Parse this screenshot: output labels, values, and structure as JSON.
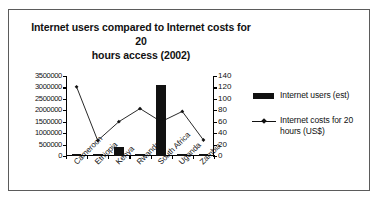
{
  "chart_data": {
    "type": "bar",
    "title": "Internet users compared to Internet costs for 20 hours access (2002)",
    "title_line1": "Internet users compared to Internet costs for 20",
    "title_line2": "hours access (2002)",
    "xlabel": "",
    "ylabel": "",
    "grid": false,
    "legend_position": "right",
    "categories": [
      "Cameroon",
      "Ethiopia",
      "Kenya",
      "Rwanda",
      "South Africa",
      "Uganda",
      "Zambia"
    ],
    "series": [
      {
        "name": "Internet users (est)",
        "type": "bar",
        "axis": "left",
        "values": [
          60000,
          25000,
          400000,
          25000,
          3100000,
          100000,
          25000
        ]
      },
      {
        "name": "Internet costs for 20 hours (US$)",
        "type": "line",
        "axis": "right",
        "values": [
          121,
          27,
          60,
          83,
          60,
          78,
          28
        ]
      }
    ],
    "y_left": {
      "label": "",
      "ylim": [
        0,
        3500000
      ],
      "ticks": [
        0,
        500000,
        1000000,
        1500000,
        2000000,
        2500000,
        3000000,
        3500000
      ],
      "tick_labels": [
        "0",
        "500000",
        "1000000",
        "1500000",
        "2000000",
        "2500000",
        "3000000",
        "3500000"
      ]
    },
    "y_right": {
      "label": "",
      "ylim": [
        0,
        140
      ],
      "ticks": [
        0,
        20,
        40,
        60,
        80,
        100,
        120,
        140
      ],
      "tick_labels": [
        "0",
        "20",
        "40",
        "60",
        "80",
        "100",
        "120",
        "140"
      ]
    },
    "legend": [
      {
        "label": "Internet users (est)",
        "marker": "bar-swatch",
        "color": "#111111"
      },
      {
        "label": "Internet costs for 20 hours (US$)",
        "marker": "line-diamond",
        "color": "#111111"
      }
    ]
  },
  "colors": {
    "bar": "#111111",
    "line": "#111111",
    "axis": "#000000",
    "frame": "#5b5b5b",
    "background": "#ffffff",
    "text": "#111111"
  }
}
